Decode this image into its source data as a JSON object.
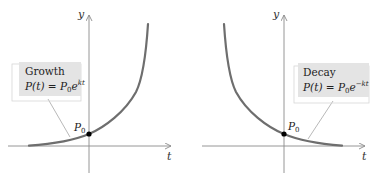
{
  "colors": {
    "axis": "#8a8a8a",
    "curve": "#6e6e6e",
    "box_fill": "#e4e4e4",
    "box_shadow": "#ffffff",
    "box_border": "#c8c8c8",
    "leader": "#9a9a9a",
    "dot": "#000000",
    "text": "#222222"
  },
  "graphs": [
    {
      "id": "growth",
      "y_axis_label": "y",
      "t_axis_label": "t",
      "point_label_base": "P",
      "point_label_sub": "0",
      "box_title": "Growth",
      "formula_lhs": "P(t)",
      "formula_eq": "=",
      "formula_base": "P",
      "formula_base_sub": "0",
      "formula_e": "e",
      "formula_exp": "kt"
    },
    {
      "id": "decay",
      "y_axis_label": "y",
      "t_axis_label": "t",
      "point_label_base": "P",
      "point_label_sub": "0",
      "box_title": "Decay",
      "formula_lhs": "P(t)",
      "formula_eq": "=",
      "formula_base": "P",
      "formula_base_sub": "0",
      "formula_e": "e",
      "formula_exp": "−kt"
    }
  ]
}
